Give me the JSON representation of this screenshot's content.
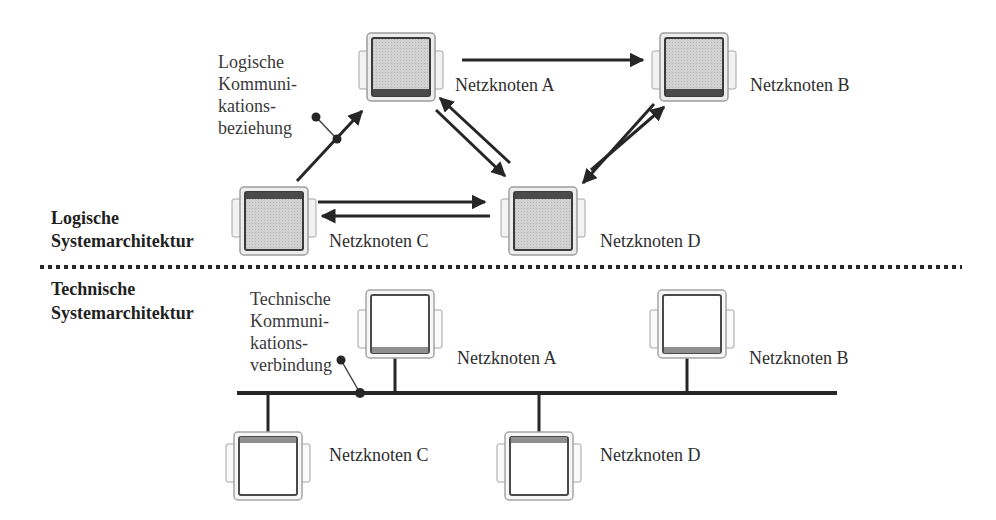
{
  "sections": {
    "logical": {
      "line1": "Logische",
      "line2": "Systemarchitektur"
    },
    "technical": {
      "line1": "Technische",
      "line2": "Systemarchitektur"
    }
  },
  "annotations": {
    "logical_comm": {
      "lines": [
        "Logische",
        "Kommuni-",
        "kations-",
        "beziehung"
      ]
    },
    "technical_comm": {
      "lines": [
        "Technische",
        "Kommuni-",
        "kations-",
        "verbindung"
      ]
    }
  },
  "logical_nodes": {
    "a": {
      "label": "Netzknoten A"
    },
    "b": {
      "label": "Netzknoten B"
    },
    "c": {
      "label": "Netzknoten C"
    },
    "d": {
      "label": "Netzknoten D"
    }
  },
  "technical_nodes": {
    "a": {
      "label": "Netzknoten A"
    },
    "b": {
      "label": "Netzknoten B"
    },
    "c": {
      "label": "Netzknoten C"
    },
    "d": {
      "label": "Netzknoten D"
    }
  },
  "colors": {
    "line": "#262626",
    "logical_fill": "#c9c9c9",
    "technical_fill": "#ffffff",
    "connector": "#5a5a5a",
    "divider": "#2a2a2a"
  }
}
